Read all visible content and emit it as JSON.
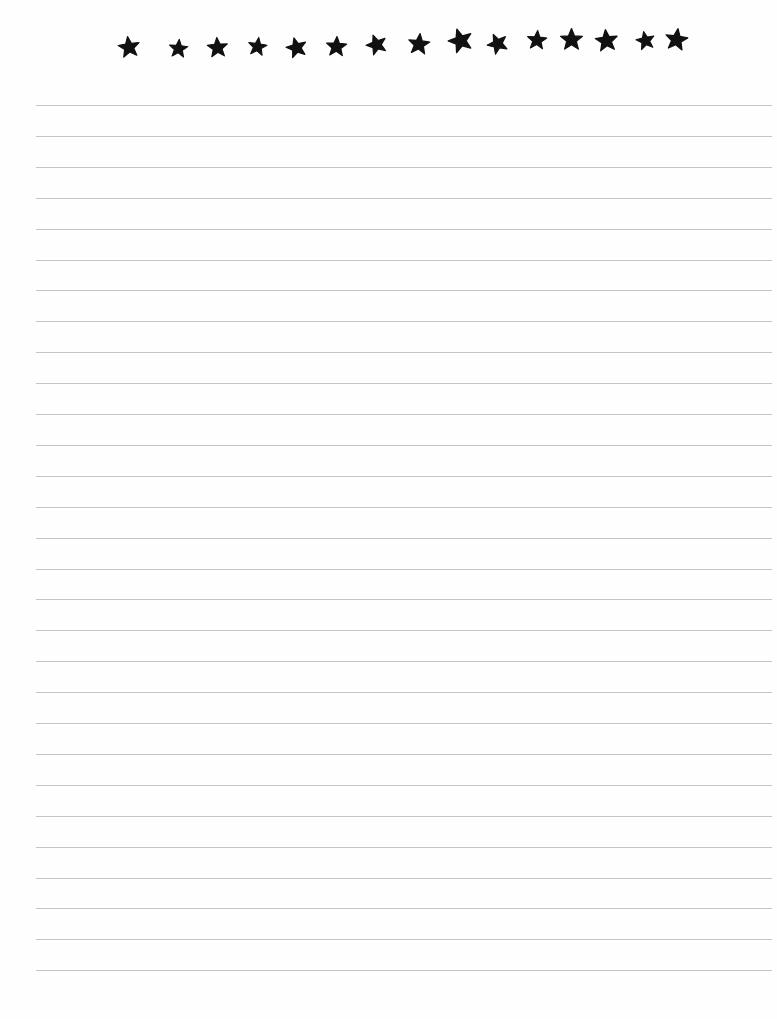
{
  "page": {
    "type": "lined-paper",
    "background": "#ffffff",
    "rule_color": "#c4c4c4",
    "star_color": "#111111"
  },
  "header": {
    "border": "stars",
    "star_count": 15,
    "stars": [
      {
        "x": 129,
        "y": 47,
        "size": 24,
        "rot": -8
      },
      {
        "x": 178,
        "y": 48,
        "size": 21,
        "rot": 5
      },
      {
        "x": 217,
        "y": 47,
        "size": 23,
        "rot": -4
      },
      {
        "x": 257,
        "y": 46,
        "size": 21,
        "rot": 8
      },
      {
        "x": 296,
        "y": 47,
        "size": 23,
        "rot": -15
      },
      {
        "x": 336,
        "y": 46,
        "size": 23,
        "rot": 3
      },
      {
        "x": 376,
        "y": 44,
        "size": 23,
        "rot": -20
      },
      {
        "x": 419,
        "y": 44,
        "size": 24,
        "rot": 6
      },
      {
        "x": 460,
        "y": 40,
        "size": 27,
        "rot": -18
      },
      {
        "x": 497,
        "y": 43,
        "size": 23,
        "rot": -25
      },
      {
        "x": 537,
        "y": 40,
        "size": 22,
        "rot": 4
      },
      {
        "x": 571,
        "y": 39,
        "size": 25,
        "rot": 0
      },
      {
        "x": 606,
        "y": 40,
        "size": 25,
        "rot": -6
      },
      {
        "x": 645,
        "y": 40,
        "size": 21,
        "rot": -12
      },
      {
        "x": 676,
        "y": 39,
        "size": 25,
        "rot": 8
      }
    ]
  },
  "rules": {
    "count": 29,
    "first_y": 105,
    "spacing": 30.9,
    "left": 36,
    "right": 772
  }
}
